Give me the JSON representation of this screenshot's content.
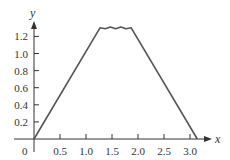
{
  "chart_data": {
    "type": "line",
    "title": "",
    "xlabel": "x",
    "ylabel": "y",
    "xlim": [
      0,
      3.3
    ],
    "ylim": [
      0,
      1.35
    ],
    "x_ticks": [
      "0.5",
      "1.0",
      "1.5",
      "2.0",
      "2.5",
      "3.0"
    ],
    "y_ticks": [
      "0.2",
      "0.4",
      "0.6",
      "0.8",
      "1.0",
      "1.2"
    ],
    "origin_label": "0",
    "grid": false,
    "legend": null,
    "series": [
      {
        "name": "f(x)",
        "x": [
          0,
          1.27,
          1.37,
          1.47,
          1.57,
          1.67,
          1.77,
          1.87,
          3.14
        ],
        "y": [
          0,
          1.3,
          1.29,
          1.31,
          1.29,
          1.31,
          1.29,
          1.3,
          0
        ]
      }
    ],
    "colors": {
      "line": "#555555",
      "axis": "#333333"
    }
  }
}
